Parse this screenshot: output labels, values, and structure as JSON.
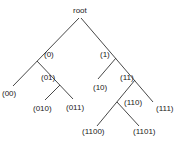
{
  "diagram": {
    "type": "binary-tree",
    "line_color": "#333333",
    "nodes": {
      "root": "root",
      "n0": "(0)",
      "n1": "(1)",
      "n00": "(00)",
      "n01": "(01)",
      "n10": "(10)",
      "n11": "(11)",
      "n010": "(010)",
      "n011": "(011)",
      "n110": "(110)",
      "n111": "(111)",
      "n1100": "(1100)",
      "n1101": "(1101)"
    }
  }
}
